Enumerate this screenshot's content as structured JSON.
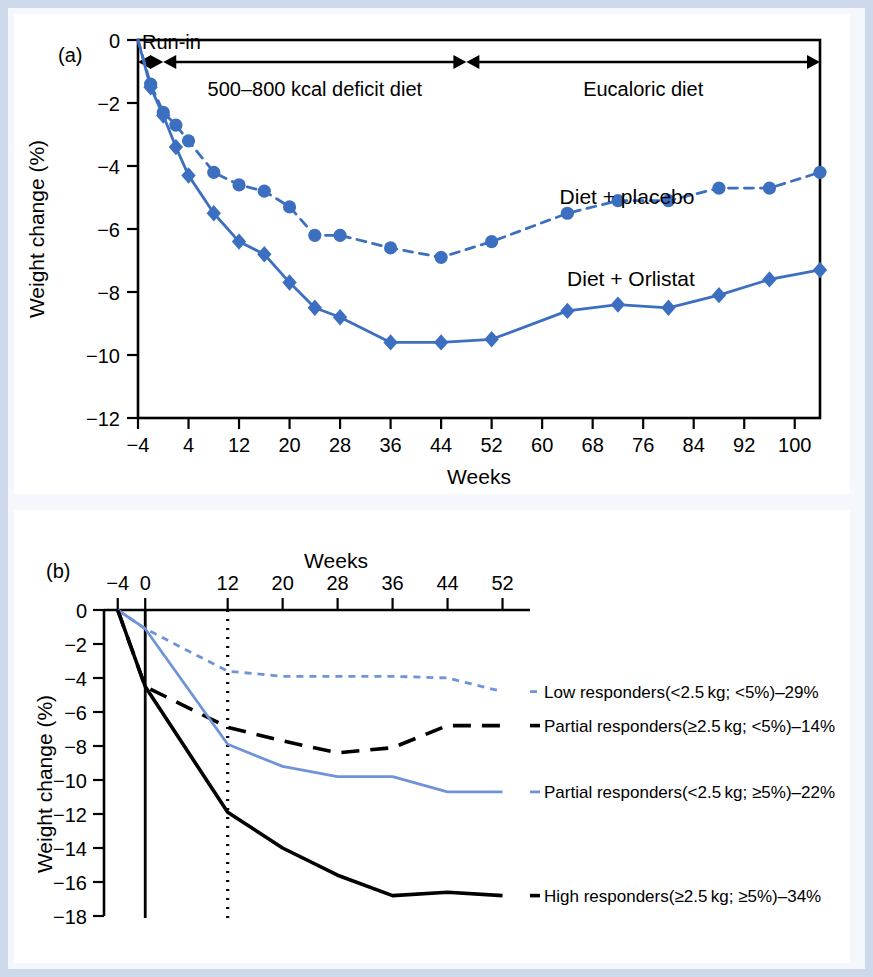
{
  "figure": {
    "border_color": "#cdd8ea",
    "background": "#f4f7fb",
    "panel_background": "#ffffff"
  },
  "panel_a": {
    "label": "(a)",
    "xlabel": "Weeks",
    "ylabel": "Weight change (%)",
    "bands": [
      {
        "name": "run-in",
        "label": "Run-in",
        "from": -4,
        "to": 0
      },
      {
        "name": "deficit",
        "label": "500–800 kcal deficit diet",
        "from": 0,
        "to": 48
      },
      {
        "name": "eucaloric",
        "label": "Eucaloric diet",
        "from": 48,
        "to": 104
      }
    ],
    "series_labels": {
      "placebo": "Diet + placebo",
      "orlistat": "Diet + Orlistat"
    }
  },
  "panel_b": {
    "label": "(b)",
    "xlabel": "Weeks",
    "ylabel": "Weight change (%)",
    "legend": [
      "Low responders(<2.5 kg; <5%)–29%",
      "Partial responders(≥2.5 kg; <5%)–14%",
      "Partial responders(<2.5 kg; ≥5%)–22%",
      "High responders(≥2.5 kg; ≥5%)–34%"
    ]
  },
  "chart_data": [
    {
      "type": "line",
      "name": "panel-a",
      "title": "(a)",
      "xlabel": "Weeks",
      "ylabel": "Weight change (%)",
      "xlim": [
        -4,
        104
      ],
      "ylim": [
        -12,
        0
      ],
      "xticks": [
        -4,
        4,
        12,
        20,
        28,
        36,
        44,
        52,
        60,
        68,
        76,
        84,
        92,
        100
      ],
      "yticks": [
        0,
        -2,
        -4,
        -6,
        -8,
        -10,
        -12
      ],
      "grid": false,
      "legend_position": "inline-annotation",
      "annotations": [
        "Run-in",
        "500–800 kcal deficit diet",
        "Eucaloric diet",
        "Diet + placebo",
        "Diet + Orlistat"
      ],
      "series": [
        {
          "name": "Diet + placebo",
          "style": "dotted",
          "marker": "circle",
          "color": "#3d6fc0",
          "x": [
            -4,
            -2,
            0,
            2,
            4,
            8,
            12,
            16,
            20,
            24,
            28,
            36,
            44,
            52,
            64,
            72,
            80,
            88,
            96,
            104
          ],
          "y": [
            0,
            -1.4,
            -2.3,
            -2.7,
            -3.2,
            -4.2,
            -4.6,
            -4.8,
            -5.3,
            -6.2,
            -6.2,
            -6.6,
            -6.9,
            -6.4,
            -5.5,
            -5.1,
            -5.1,
            -4.7,
            -4.7,
            -4.2
          ]
        },
        {
          "name": "Diet + Orlistat",
          "style": "solid",
          "marker": "diamond",
          "color": "#3d6fc0",
          "x": [
            -4,
            -2,
            0,
            2,
            4,
            8,
            12,
            16,
            20,
            24,
            28,
            36,
            44,
            52,
            64,
            72,
            80,
            88,
            96,
            104
          ],
          "y": [
            0,
            -1.5,
            -2.4,
            -3.4,
            -4.3,
            -5.5,
            -6.4,
            -6.8,
            -7.7,
            -8.5,
            -8.8,
            -9.6,
            -9.6,
            -9.5,
            -8.6,
            -8.4,
            -8.5,
            -8.1,
            -7.6,
            -7.3
          ]
        }
      ]
    },
    {
      "type": "line",
      "name": "panel-b",
      "title": "(b)",
      "xlabel": "Weeks",
      "ylabel": "Weight change (%)",
      "xlim": [
        -6,
        56
      ],
      "ylim": [
        -18,
        0
      ],
      "xticks": [
        -4,
        0,
        12,
        20,
        28,
        36,
        44,
        52
      ],
      "yticks": [
        0,
        -2,
        -4,
        -6,
        -8,
        -10,
        -12,
        -14,
        -16,
        -18
      ],
      "grid": false,
      "xaxis_position": "top",
      "legend_position": "right",
      "vertical_markers": [
        {
          "x": 0,
          "style": "solid"
        },
        {
          "x": 12,
          "style": "dotted"
        }
      ],
      "series": [
        {
          "name": "Low responders(<2.5 kg; <5%)–29%",
          "style": "dotted",
          "color": "#6e93d8",
          "x": [
            -4,
            0,
            12,
            20,
            28,
            36,
            44,
            52
          ],
          "y": [
            0,
            -1.1,
            -3.6,
            -3.9,
            -3.9,
            -3.9,
            -4.0,
            -4.8
          ]
        },
        {
          "name": "Partial responders(≥2.5 kg; <5%)–14%",
          "style": "dashed",
          "color": "#000000",
          "x": [
            -4,
            0,
            12,
            20,
            28,
            36,
            44,
            52
          ],
          "y": [
            0,
            -4.5,
            -6.9,
            -7.7,
            -8.4,
            -8.1,
            -6.8,
            -6.8
          ]
        },
        {
          "name": "Partial responders(<2.5 kg; ≥5%)–22%",
          "style": "solid",
          "color": "#6e93d8",
          "x": [
            -4,
            0,
            12,
            20,
            28,
            36,
            44,
            52
          ],
          "y": [
            0,
            -1.1,
            -7.9,
            -9.2,
            -9.8,
            -9.8,
            -10.7,
            -10.7
          ]
        },
        {
          "name": "High responders(≥2.5 kg; ≥5%)–34%",
          "style": "solid",
          "color": "#000000",
          "x": [
            -4,
            0,
            12,
            20,
            28,
            36,
            44,
            52
          ],
          "y": [
            0,
            -4.5,
            -11.9,
            -14.0,
            -15.6,
            -16.8,
            -16.6,
            -16.8
          ]
        }
      ]
    }
  ]
}
